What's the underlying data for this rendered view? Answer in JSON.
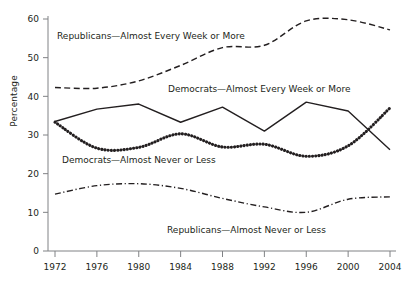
{
  "axis": {
    "y_label": "Percentage",
    "y_ticks": [
      "0",
      "10",
      "20",
      "30",
      "40",
      "50",
      "60"
    ],
    "x_ticks": [
      "1972",
      "1976",
      "1980",
      "1984",
      "1988",
      "1992",
      "1996",
      "2000",
      "2004"
    ]
  },
  "annotations": {
    "rep_high": "Republicans—Almost Every Week or More",
    "dem_high": "Democrats—Almost Every Week or More",
    "dem_low": "Democrats—Almost Never or Less",
    "rep_low": "Republicans—Almost Never or Less"
  },
  "chart_data": {
    "type": "line",
    "title": "",
    "xlabel": "",
    "ylabel": "Percentage",
    "xlim": [
      1972,
      2004
    ],
    "ylim": [
      0,
      60
    ],
    "grid": false,
    "legend": "inline-annotations",
    "categories": [
      1972,
      1976,
      1980,
      1984,
      1988,
      1992,
      1996,
      2000,
      2004
    ],
    "series": [
      {
        "name": "Republicans—Almost Every Week or More",
        "style": "dashed",
        "color": "#231f20",
        "values": [
          42.3,
          42.1,
          44.0,
          48.0,
          52.6,
          53.2,
          59.5,
          59.8,
          57.2
        ]
      },
      {
        "name": "Democrats—Almost Every Week or More",
        "style": "solid",
        "color": "#231f20",
        "values": [
          33.5,
          36.7,
          38.0,
          33.3,
          37.2,
          31.0,
          38.5,
          36.2,
          26.2
        ]
      },
      {
        "name": "Democrats—Almost Never or Less",
        "style": "dotted",
        "color": "#231f20",
        "values": [
          33.3,
          26.6,
          26.8,
          30.3,
          26.9,
          27.6,
          24.5,
          27.2,
          37.0
        ]
      },
      {
        "name": "Republicans—Almost Never or Less",
        "style": "dashdot",
        "color": "#231f20",
        "values": [
          14.7,
          16.9,
          17.4,
          16.2,
          13.6,
          11.4,
          10.0,
          13.4,
          14.0
        ]
      }
    ]
  }
}
